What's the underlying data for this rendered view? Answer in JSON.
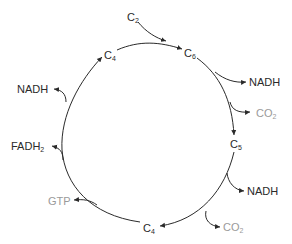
{
  "diagram": {
    "colors": {
      "line": "#2a2a2a",
      "product_dark": "#2a2a2a",
      "product_grey": "#9a9a9a"
    },
    "nodes": [
      {
        "id": "c2",
        "base": "C",
        "sub": "2"
      },
      {
        "id": "c4_top",
        "base": "C",
        "sub": "4"
      },
      {
        "id": "c6",
        "base": "C",
        "sub": "6"
      },
      {
        "id": "c5",
        "base": "C",
        "sub": "5"
      },
      {
        "id": "c4_bottom",
        "base": "C",
        "sub": "4"
      }
    ],
    "products": [
      {
        "id": "nadh_1",
        "base": "NADH",
        "sub": "",
        "color": "dark",
        "from": "c6->c5"
      },
      {
        "id": "co2_1",
        "base": "CO",
        "sub": "2",
        "color": "grey",
        "from": "c6->c5"
      },
      {
        "id": "nadh_2",
        "base": "NADH",
        "sub": "",
        "color": "dark",
        "from": "c5->c4_bottom"
      },
      {
        "id": "co2_2",
        "base": "CO",
        "sub": "2",
        "color": "grey",
        "from": "c5->c4_bottom"
      },
      {
        "id": "gtp",
        "base": "GTP",
        "sub": "",
        "color": "grey",
        "from": "c4_bottom->c4_top"
      },
      {
        "id": "fadh2",
        "base": "FADH",
        "sub": "2",
        "color": "dark",
        "from": "c4_bottom->c4_top"
      },
      {
        "id": "nadh_3",
        "base": "NADH",
        "sub": "",
        "color": "dark",
        "from": "c4_bottom->c4_top"
      }
    ]
  }
}
